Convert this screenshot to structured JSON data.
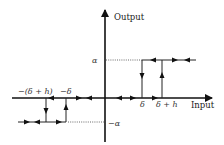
{
  "diagram": {
    "type": "hysteresis-with-dead-zone",
    "axes": {
      "x_label": "Input",
      "y_label": "Output"
    },
    "levels": {
      "positive": "α",
      "negative": "−α"
    },
    "thresholds": {
      "pos_inner": "δ",
      "pos_outer": "δ + h",
      "neg_inner": "−δ",
      "neg_outer": "−(δ + h)"
    },
    "colors": {
      "line": "#222222",
      "dotted": "#444444"
    }
  }
}
